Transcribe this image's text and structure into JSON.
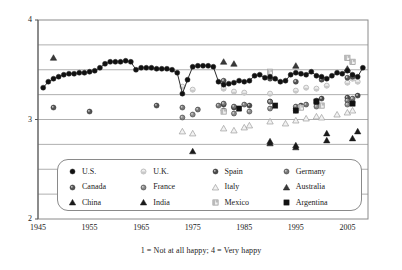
{
  "caption": "1 = Not at all happy; 4 = Very happy",
  "legend": {
    "items": [
      {
        "label": "U.S.",
        "marker": "circle-filled-black",
        "color": "#111111"
      },
      {
        "label": "U.K.",
        "marker": "circle-crescent-light",
        "color": "#d8d8d8"
      },
      {
        "label": "Spain",
        "marker": "circle-filled-dark",
        "color": "#4a4a4a"
      },
      {
        "label": "Germany",
        "marker": "circle-filled-gray",
        "color": "#777777"
      },
      {
        "label": "Canada",
        "marker": "circle-filled-dark",
        "color": "#555555"
      },
      {
        "label": "France",
        "marker": "circle-filled-gray",
        "color": "#8a8a8a"
      },
      {
        "label": "Italy",
        "marker": "triangle-open-light",
        "color": "#b5b5b5"
      },
      {
        "label": "Australia",
        "marker": "triangle-filled-dark",
        "color": "#3a3a3a"
      },
      {
        "label": "China",
        "marker": "triangle-filled-black",
        "color": "#1a1a1a"
      },
      {
        "label": "India",
        "marker": "triangle-filled-black",
        "color": "#1a1a1a"
      },
      {
        "label": "Mexico",
        "marker": "square-half-light",
        "color": "#bdbdbd"
      },
      {
        "label": "Argentina",
        "marker": "square-filled-black",
        "color": "#111111"
      }
    ]
  },
  "chart_data": {
    "type": "scatter",
    "title": "",
    "xlabel": "",
    "ylabel": "",
    "xlim": [
      1945,
      2009
    ],
    "ylim": [
      2,
      4
    ],
    "xticks": [
      1945,
      1955,
      1965,
      1975,
      1985,
      1995,
      2005
    ],
    "yticks": [
      2,
      3,
      4
    ],
    "ytick_labels": [
      "2",
      "3",
      "4"
    ],
    "gridlines_y": [
      2.25,
      2.5,
      2.75,
      3.0,
      3.25,
      3.5,
      3.75
    ],
    "grid": true,
    "legend_position": "lower-center",
    "series": [
      {
        "name": "U.S.",
        "marker": "circle-filled-black",
        "connected": true,
        "points": [
          [
            1946,
            3.32
          ],
          [
            1947,
            3.38
          ],
          [
            1948,
            3.41
          ],
          [
            1949,
            3.43
          ],
          [
            1950,
            3.45
          ],
          [
            1951,
            3.46
          ],
          [
            1952,
            3.46
          ],
          [
            1953,
            3.47
          ],
          [
            1954,
            3.47
          ],
          [
            1955,
            3.48
          ],
          [
            1956,
            3.49
          ],
          [
            1957,
            3.52
          ],
          [
            1958,
            3.56
          ],
          [
            1959,
            3.58
          ],
          [
            1960,
            3.58
          ],
          [
            1961,
            3.58
          ],
          [
            1962,
            3.59
          ],
          [
            1963,
            3.58
          ],
          [
            1964,
            3.5
          ],
          [
            1965,
            3.52
          ],
          [
            1966,
            3.52
          ],
          [
            1967,
            3.52
          ],
          [
            1968,
            3.51
          ],
          [
            1969,
            3.51
          ],
          [
            1970,
            3.51
          ],
          [
            1971,
            3.5
          ],
          [
            1972,
            3.47
          ],
          [
            1973,
            3.26
          ],
          [
            1974,
            3.4
          ],
          [
            1975,
            3.53
          ],
          [
            1976,
            3.54
          ],
          [
            1977,
            3.54
          ],
          [
            1978,
            3.54
          ],
          [
            1979,
            3.53
          ],
          [
            1980,
            3.38
          ],
          [
            1981,
            3.35
          ],
          [
            1982,
            3.36
          ],
          [
            1983,
            3.37
          ],
          [
            1984,
            3.39
          ],
          [
            1985,
            3.38
          ],
          [
            1986,
            3.39
          ],
          [
            1987,
            3.44
          ],
          [
            1988,
            3.45
          ],
          [
            1989,
            3.42
          ],
          [
            1990,
            3.43
          ],
          [
            1991,
            3.41
          ],
          [
            1992,
            3.38
          ],
          [
            1993,
            3.39
          ],
          [
            1994,
            3.45
          ],
          [
            1995,
            3.47
          ],
          [
            1996,
            3.46
          ],
          [
            1997,
            3.45
          ],
          [
            1998,
            3.48
          ],
          [
            1999,
            3.44
          ],
          [
            2000,
            3.43
          ],
          [
            2001,
            3.41
          ],
          [
            2002,
            3.44
          ],
          [
            2003,
            3.47
          ],
          [
            2004,
            3.46
          ],
          [
            2005,
            3.49
          ],
          [
            2006,
            3.45
          ],
          [
            2007,
            3.43
          ],
          [
            2008,
            3.52
          ]
        ]
      },
      {
        "name": "U.K.",
        "marker": "circle-crescent-light",
        "connected": false,
        "points": [
          [
            1973,
            3.33
          ],
          [
            1975,
            3.3
          ],
          [
            1981,
            3.31
          ],
          [
            1983,
            3.28
          ],
          [
            1985,
            3.27
          ],
          [
            1990,
            3.26
          ],
          [
            1995,
            3.29
          ],
          [
            1997,
            3.32
          ],
          [
            1999,
            3.31
          ],
          [
            2001,
            3.34
          ],
          [
            2005,
            3.37
          ],
          [
            2006,
            3.41
          ],
          [
            2007,
            3.38
          ]
        ]
      },
      {
        "name": "Spain",
        "marker": "circle-filled-dark",
        "connected": false,
        "points": [
          [
            1981,
            3.15
          ],
          [
            1983,
            3.12
          ],
          [
            1986,
            3.14
          ],
          [
            1990,
            3.18
          ],
          [
            1995,
            3.11
          ],
          [
            1996,
            3.14
          ],
          [
            1999,
            3.19
          ],
          [
            2000,
            3.21
          ],
          [
            2005,
            3.22
          ],
          [
            2007,
            3.24
          ]
        ]
      },
      {
        "name": "Germany",
        "marker": "circle-filled-gray",
        "connected": false,
        "points": [
          [
            1973,
            3.12
          ],
          [
            1976,
            3.1
          ],
          [
            1980,
            3.14
          ],
          [
            1981,
            3.16
          ],
          [
            1983,
            3.13
          ],
          [
            1985,
            3.15
          ],
          [
            1990,
            3.18
          ],
          [
            1995,
            3.13
          ],
          [
            1997,
            3.15
          ],
          [
            1999,
            3.17
          ],
          [
            2005,
            3.19
          ],
          [
            2006,
            3.21
          ]
        ]
      },
      {
        "name": "Canada",
        "marker": "circle-filled-dark",
        "connected": false,
        "points": [
          [
            1948,
            3.12
          ],
          [
            1955,
            3.08
          ],
          [
            1968,
            3.14
          ],
          [
            1981,
            3.39
          ],
          [
            1990,
            3.41
          ],
          [
            1995,
            3.38
          ],
          [
            2000,
            3.4
          ],
          [
            2005,
            3.42
          ],
          [
            2006,
            3.43
          ]
        ]
      },
      {
        "name": "France",
        "marker": "circle-filled-gray",
        "connected": false,
        "points": [
          [
            1973,
            3.02
          ],
          [
            1975,
            3.05
          ],
          [
            1981,
            3.09
          ],
          [
            1983,
            3.06
          ],
          [
            1986,
            3.08
          ],
          [
            1990,
            3.11
          ],
          [
            1995,
            3.09
          ],
          [
            1999,
            3.13
          ],
          [
            2005,
            3.15
          ],
          [
            2006,
            3.17
          ]
        ]
      },
      {
        "name": "Italy",
        "marker": "triangle-open-light",
        "connected": false,
        "points": [
          [
            1973,
            2.88
          ],
          [
            1975,
            2.86
          ],
          [
            1981,
            2.91
          ],
          [
            1983,
            2.89
          ],
          [
            1985,
            2.92
          ],
          [
            1986,
            2.94
          ],
          [
            1990,
            2.98
          ],
          [
            1993,
            2.96
          ],
          [
            1995,
            2.99
          ],
          [
            1997,
            3.01
          ],
          [
            1999,
            3.03
          ],
          [
            2000,
            3.02
          ],
          [
            2003,
            3.05
          ],
          [
            2005,
            3.07
          ],
          [
            2006,
            3.09
          ]
        ]
      },
      {
        "name": "Australia",
        "marker": "triangle-filled-dark",
        "connected": false,
        "points": [
          [
            1948,
            3.62
          ],
          [
            1981,
            3.58
          ],
          [
            1983,
            3.56
          ],
          [
            1995,
            3.54
          ],
          [
            2005,
            3.51
          ]
        ]
      },
      {
        "name": "China",
        "marker": "triangle-filled-black",
        "connected": false,
        "points": [
          [
            1990,
            2.78
          ],
          [
            1995,
            2.74
          ],
          [
            2001,
            2.86
          ],
          [
            2007,
            2.88
          ]
        ]
      },
      {
        "name": "India",
        "marker": "triangle-filled-black",
        "connected": false,
        "points": [
          [
            1975,
            2.68
          ],
          [
            1990,
            2.76
          ],
          [
            1995,
            2.72
          ],
          [
            2001,
            2.79
          ],
          [
            2006,
            2.81
          ]
        ]
      },
      {
        "name": "Mexico",
        "marker": "square-half-light",
        "connected": false,
        "points": [
          [
            1981,
            3.08
          ],
          [
            1990,
            3.48
          ],
          [
            1996,
            3.12
          ],
          [
            2000,
            3.14
          ],
          [
            2005,
            3.62
          ],
          [
            2006,
            3.58
          ]
        ]
      },
      {
        "name": "Argentina",
        "marker": "square-filled-black",
        "connected": false,
        "points": [
          [
            1984,
            3.11
          ],
          [
            1991,
            3.14
          ],
          [
            1995,
            3.09
          ],
          [
            1999,
            3.18
          ],
          [
            2006,
            3.16
          ]
        ]
      }
    ]
  }
}
